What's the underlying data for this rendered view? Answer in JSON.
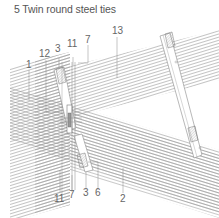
{
  "figure": {
    "number": "5",
    "title": "5  Twin round steel ties"
  },
  "colors": {
    "hatch": "#9a9a9a",
    "outline": "#888888",
    "label": "#666666",
    "steel_fill": "#ffffff"
  },
  "labels": {
    "l1": "1",
    "l12": "12",
    "l3_top": "3",
    "l11_top": "11",
    "l7_top": "7",
    "l13": "13",
    "l11_bottom": "11",
    "l7_bottom": "7",
    "l3_bottom": "3",
    "l6": "6",
    "l2": "2"
  },
  "components": [
    {
      "id": "1",
      "description": "timber post (left)"
    },
    {
      "id": "2",
      "description": "timber beam (lower)"
    },
    {
      "id": "13",
      "description": "timber rafter (upper)"
    },
    {
      "id": "3",
      "description": "steel bracket"
    },
    {
      "id": "6",
      "description": "end plate"
    },
    {
      "id": "7",
      "description": "tie rod"
    },
    {
      "id": "11",
      "description": "tie rod"
    },
    {
      "id": "12",
      "description": "bracket edge"
    }
  ]
}
